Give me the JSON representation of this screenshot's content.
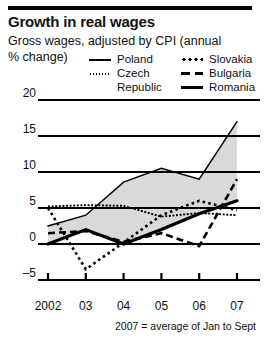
{
  "header": {
    "title": "Growth in real wages",
    "subtitle_line1": "Gross wages, adjusted by CPI (annual",
    "subtitle_line2": "% change)"
  },
  "legend": {
    "left": [
      {
        "label": "Poland",
        "style": "solid-thin",
        "swatch": true
      },
      {
        "label": "Czech",
        "style": "dot-fine",
        "swatch": true
      },
      {
        "label": "Republic",
        "style": "none",
        "swatch": false
      }
    ],
    "right": [
      {
        "label": "Slovakia",
        "style": "dot-coarse",
        "swatch": true
      },
      {
        "label": "Bulgaria",
        "style": "dash",
        "swatch": true
      },
      {
        "label": "Romania",
        "style": "thick",
        "swatch": true
      }
    ]
  },
  "footnote": "2007 = average of Jan to Sept",
  "chart_data": {
    "type": "line",
    "title": "Growth in real wages",
    "subtitle": "Gross wages, adjusted by CPI (annual % change)",
    "xlabel": "",
    "ylabel": "",
    "x": [
      2002,
      2003,
      2004,
      2005,
      2006,
      2007
    ],
    "categories": [
      "2002",
      "03",
      "04",
      "05",
      "06",
      "07"
    ],
    "ylim": [
      -5,
      20
    ],
    "yticks": [
      -5,
      0,
      5,
      10,
      15,
      20
    ],
    "ytick_labels": [
      "–5",
      "0",
      "5",
      "10",
      "15",
      "20"
    ],
    "grid": true,
    "legend_position": "top",
    "shaded_band": {
      "description": "grey band between highest (Poland) and lowest (Romania) series",
      "upper_series": "Poland",
      "lower_series": "Romania",
      "color": "#d9d9d9"
    },
    "series": [
      {
        "name": "Poland",
        "style": "solid-thin",
        "values": [
          2.5,
          4.0,
          8.6,
          10.5,
          9.0,
          17.0
        ]
      },
      {
        "name": "Czech",
        "style": "dot-fine",
        "values": [
          5.2,
          5.4,
          5.3,
          3.8,
          4.3,
          4.0
        ]
      },
      {
        "name": "Slovakia",
        "style": "dot-coarse",
        "values": [
          5.0,
          -3.5,
          0.2,
          4.0,
          6.0,
          4.7
        ]
      },
      {
        "name": "Bulgaria",
        "style": "dash",
        "values": [
          1.5,
          1.8,
          0.3,
          1.5,
          -0.3,
          9.0
        ]
      },
      {
        "name": "Romania",
        "style": "thick",
        "values": [
          0.0,
          2.0,
          0.0,
          2.0,
          4.2,
          6.0
        ]
      }
    ]
  }
}
